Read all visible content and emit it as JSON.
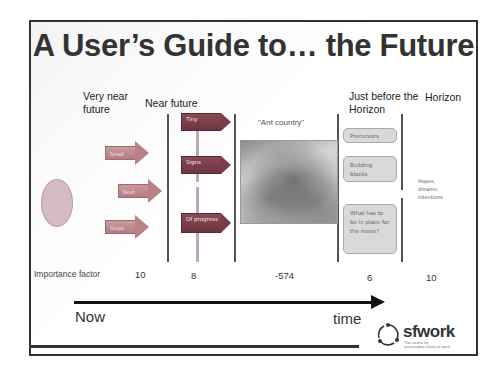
{
  "slide": {
    "title": "A User’s Guide to… the Future",
    "columns": [
      {
        "id": "very-near",
        "heading_line1": "Very near",
        "heading_line2": "future",
        "importance": "10"
      },
      {
        "id": "near",
        "heading_line1": "Near future",
        "heading_line2": "",
        "importance": "8"
      },
      {
        "id": "ant",
        "heading_line1": "",
        "heading_line2": "",
        "importance": "-574"
      },
      {
        "id": "just-before",
        "heading_line1": "Just before the",
        "heading_line2": "Horizon",
        "importance": "6"
      },
      {
        "id": "horizon",
        "heading_line1": "Horizon",
        "heading_line2": "",
        "importance": "10"
      }
    ],
    "arrows": [
      "Small",
      "Next",
      "Steps"
    ],
    "signs": [
      "Tiny",
      "Signs",
      "Of progress"
    ],
    "ant_caption": "\"Ant country\"",
    "boxes": [
      "Precursors",
      "Building blocks",
      "What has to be in place for the move?"
    ],
    "horizon_text": "Hopes, dreams, intentions",
    "importance_label": "Importance factor",
    "timeline": {
      "start_label": "Now",
      "end_label": "time"
    },
    "logo": {
      "name": "sfwork",
      "tagline_line1": "The centre for",
      "tagline_line2": "sustainable future at work"
    },
    "colors": {
      "arrow": "#b88287",
      "sign": "#7a3d48",
      "oval": "#d4bcc2",
      "box": "#d9d9d9"
    }
  }
}
